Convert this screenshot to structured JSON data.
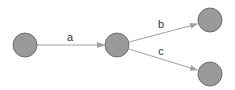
{
  "diagram": {
    "type": "directed-graph",
    "colors": {
      "node_fill": "#9a9a9a",
      "node_stroke": "#6e6e6e",
      "edge": "#a0a0a0",
      "label": "#333333",
      "background": "#ffffff"
    },
    "nodes": [
      {
        "id": "n1",
        "cx": 25,
        "cy": 45,
        "r": 12
      },
      {
        "id": "n2",
        "cx": 117,
        "cy": 45,
        "r": 12
      },
      {
        "id": "n3",
        "cx": 210,
        "cy": 20,
        "r": 12
      },
      {
        "id": "n4",
        "cx": 210,
        "cy": 74,
        "r": 12
      }
    ],
    "edges": [
      {
        "from": "n1",
        "to": "n2",
        "label": "a"
      },
      {
        "from": "n2",
        "to": "n3",
        "label": "b"
      },
      {
        "from": "n2",
        "to": "n4",
        "label": "c"
      }
    ]
  }
}
